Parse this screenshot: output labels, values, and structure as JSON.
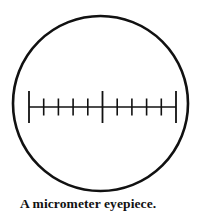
{
  "figure": {
    "caption": "A micrometer eyepiece.",
    "alt_label": "micrometer-eyepiece-diagram",
    "background_color": "#ffffff",
    "ink_color": "#111111"
  },
  "field_of_view": {
    "shape": "circle",
    "center_x": 100.5,
    "center_y": 103.5,
    "radius": 87.5,
    "stroke_width": 2.6,
    "stroke_color": "#111111",
    "fill_color": "#ffffff"
  },
  "scale": {
    "name": "micrometer-scale",
    "baseline_y": 107,
    "start_x": 29,
    "end_x": 176,
    "line_width": 1.6,
    "major_tick_height": 32,
    "minor_tick_height": 17,
    "major_tick_width": 1.8,
    "minor_tick_width": 1.6,
    "tick_color": "#111111",
    "divisions": 10,
    "major_tick_positions": [
      29,
      102.5,
      176
    ],
    "minor_tick_positions": [
      43.7,
      58.4,
      73.1,
      87.8,
      117.2,
      131.9,
      146.6,
      161.3
    ],
    "ticks": [
      {
        "x": 29,
        "type": "major",
        "index": 0
      },
      {
        "x": 43.7,
        "type": "minor",
        "index": 1
      },
      {
        "x": 58.4,
        "type": "minor",
        "index": 2
      },
      {
        "x": 73.1,
        "type": "minor",
        "index": 3
      },
      {
        "x": 87.8,
        "type": "minor",
        "index": 4
      },
      {
        "x": 102.5,
        "type": "major",
        "index": 5
      },
      {
        "x": 117.2,
        "type": "minor",
        "index": 6
      },
      {
        "x": 131.9,
        "type": "minor",
        "index": 7
      },
      {
        "x": 146.6,
        "type": "minor",
        "index": 8
      },
      {
        "x": 161.3,
        "type": "minor",
        "index": 9
      },
      {
        "x": 176,
        "type": "major",
        "index": 10
      }
    ]
  }
}
